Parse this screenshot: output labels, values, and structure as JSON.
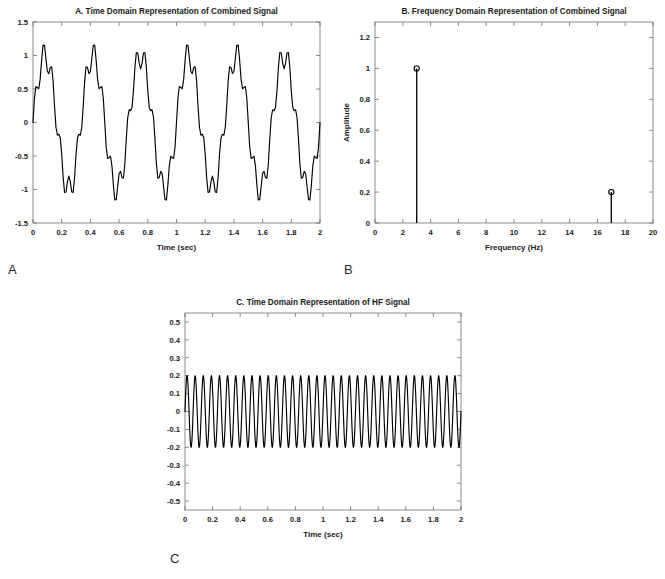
{
  "figure": {
    "panel_letters": {
      "a": "A",
      "b": "B",
      "c": "C"
    }
  },
  "chart_data": [
    {
      "id": "panel-a",
      "type": "line",
      "title": "A. Time Domain Representation of Combined Signal",
      "xlabel": "Time (sec)",
      "ylabel": "",
      "xlim": [
        0,
        2
      ],
      "ylim": [
        -1.5,
        1.5
      ],
      "xticks": [
        0,
        0.2,
        0.4,
        0.6,
        0.8,
        1,
        1.2,
        1.4,
        1.6,
        1.8,
        2
      ],
      "xticklabels": [
        "0",
        "0.2",
        "0.4",
        "0.6",
        "0.8",
        "1",
        "1.2",
        "1.4",
        "1.6",
        "1.8",
        "2"
      ],
      "yticks": [
        -1.5,
        -1,
        -0.5,
        0,
        0.5,
        1,
        1.5
      ],
      "yticklabels": [
        "-1.5",
        "-1",
        "-0.5",
        "0",
        "0.5",
        "1",
        "1.5"
      ],
      "grid": false,
      "legend": null,
      "series": [
        {
          "name": "combined signal",
          "description": "sum of a 3 Hz low-frequency sine of amplitude 1 and a 17 Hz high-frequency sine of amplitude 0.2",
          "formula": "sin(2*pi*3*t) + 0.2*sin(2*pi*17*t)",
          "components": [
            {
              "frequency_hz": 3,
              "amplitude": 1.0
            },
            {
              "frequency_hz": 17,
              "amplitude": 0.2
            }
          ],
          "sample_rate_hz": 100,
          "t_start": 0,
          "t_end": 2,
          "y_min": -1.2,
          "y_max": 1.2
        }
      ]
    },
    {
      "id": "panel-b",
      "type": "bar",
      "title": "B. Frequency Domain Representation of Combined Signal",
      "xlabel": "Frequency (Hz)",
      "ylabel": "Amplitude",
      "xlim": [
        0,
        20
      ],
      "ylim": [
        0,
        1.3
      ],
      "xticks": [
        0,
        2,
        4,
        6,
        8,
        10,
        12,
        14,
        16,
        18,
        20
      ],
      "xticklabels": [
        "0",
        "2",
        "4",
        "6",
        "8",
        "10",
        "12",
        "14",
        "16",
        "18",
        "20"
      ],
      "yticks": [
        0,
        0.2,
        0.4,
        0.6,
        0.8,
        1,
        1.2
      ],
      "yticklabels": [
        "0",
        "0.2",
        "0.4",
        "0.6",
        "0.8",
        "1",
        "1.2"
      ],
      "grid": false,
      "legend": null,
      "marker": "circle",
      "x": [
        3,
        17
      ],
      "values": [
        1.0,
        0.2
      ],
      "categories": [
        "3",
        "17"
      ]
    },
    {
      "id": "panel-c",
      "type": "line",
      "title": "C. Time Domain Representation of HF Signal",
      "xlabel": "Time (sec)",
      "ylabel": "",
      "xlim": [
        0,
        2
      ],
      "ylim": [
        -0.55,
        0.55
      ],
      "xticks": [
        0,
        0.2,
        0.4,
        0.6,
        0.8,
        1,
        1.2,
        1.4,
        1.6,
        1.8,
        2
      ],
      "xticklabels": [
        "0",
        "0.2",
        "0.4",
        "0.6",
        "0.8",
        "1",
        "1.2",
        "1.4",
        "1.6",
        "1.8",
        "2"
      ],
      "yticks": [
        -0.5,
        -0.4,
        -0.3,
        -0.2,
        -0.1,
        0,
        0.1,
        0.2,
        0.3,
        0.4,
        0.5
      ],
      "yticklabels": [
        "-0.5",
        "-0.4",
        "-0.3",
        "-0.2",
        "-0.1",
        "0",
        "0.1",
        "0.2",
        "0.3",
        "0.4",
        "0.5"
      ],
      "grid": false,
      "legend": null,
      "series": [
        {
          "name": "HF signal",
          "description": "high-frequency sine component only",
          "formula": "0.2*sin(2*pi*17*t)",
          "components": [
            {
              "frequency_hz": 17,
              "amplitude": 0.2
            }
          ],
          "sample_rate_hz": 1000,
          "t_start": 0,
          "t_end": 2,
          "y_min": -0.2,
          "y_max": 0.2
        }
      ]
    }
  ]
}
